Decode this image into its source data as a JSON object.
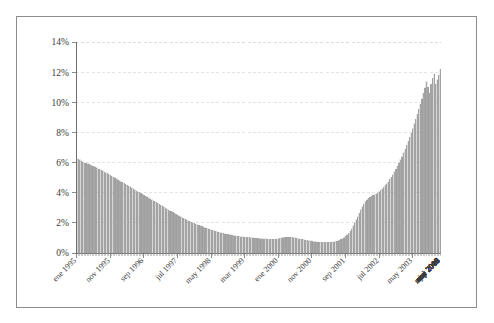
{
  "chart_data": {
    "type": "bar",
    "title": "",
    "subtitle": "",
    "xlabel": "",
    "ylabel": "",
    "ylim": [
      0,
      14
    ],
    "ytick_labels": [
      "0%",
      "2%",
      "4%",
      "6%",
      "8%",
      "10%",
      "12%",
      "14%"
    ],
    "ytick_values": [
      0,
      2,
      4,
      6,
      8,
      10,
      12,
      14
    ],
    "grid": true,
    "legend": "none",
    "xtick_labels": [
      "ene 1995",
      "nov 1995",
      "sep 1996",
      "jul 1997",
      "may 1998",
      "mar 1999",
      "ene 2000",
      "nov 2000",
      "sep 2001",
      "jul 2002",
      "may 2003",
      "mar 2004",
      "ene 2005",
      "nov 2005",
      "sep 2006",
      "jul 2007",
      "may 2008",
      "mar 2009",
      "ene 2010",
      "nov 2010",
      "sep 2011",
      "jul 2012",
      "may 2013"
    ],
    "xtick_interval_months": 22,
    "x_start": "ene 1995",
    "x_end": "jun 2013",
    "series_name": "",
    "bar_color": "#a8a8a8",
    "values": [
      6.25,
      6.22,
      6.18,
      6.12,
      6.05,
      6.0,
      5.96,
      5.92,
      5.88,
      5.84,
      5.8,
      5.76,
      5.72,
      5.66,
      5.6,
      5.55,
      5.5,
      5.45,
      5.4,
      5.34,
      5.28,
      5.22,
      5.16,
      5.1,
      5.04,
      4.98,
      4.92,
      4.86,
      4.8,
      4.74,
      4.68,
      4.62,
      4.56,
      4.5,
      4.44,
      4.38,
      4.32,
      4.26,
      4.2,
      4.14,
      4.08,
      4.02,
      3.96,
      3.9,
      3.84,
      3.78,
      3.72,
      3.66,
      3.6,
      3.54,
      3.48,
      3.42,
      3.36,
      3.3,
      3.24,
      3.18,
      3.12,
      3.06,
      3.0,
      2.94,
      2.88,
      2.82,
      2.76,
      2.7,
      2.64,
      2.58,
      2.52,
      2.46,
      2.4,
      2.35,
      2.3,
      2.25,
      2.2,
      2.15,
      2.1,
      2.05,
      2.0,
      1.96,
      1.92,
      1.88,
      1.84,
      1.8,
      1.76,
      1.72,
      1.68,
      1.64,
      1.6,
      1.57,
      1.54,
      1.51,
      1.48,
      1.45,
      1.42,
      1.39,
      1.36,
      1.33,
      1.3,
      1.28,
      1.26,
      1.24,
      1.22,
      1.2,
      1.18,
      1.16,
      1.14,
      1.12,
      1.1,
      1.09,
      1.08,
      1.07,
      1.06,
      1.05,
      1.04,
      1.03,
      1.02,
      1.01,
      1.0,
      0.99,
      0.98,
      0.97,
      0.96,
      0.95,
      0.94,
      0.93,
      0.93,
      0.92,
      0.92,
      0.91,
      0.91,
      0.9,
      0.9,
      0.92,
      0.95,
      0.98,
      1.0,
      1.02,
      1.03,
      1.04,
      1.05,
      1.05,
      1.04,
      1.03,
      1.02,
      1.0,
      0.98,
      0.96,
      0.94,
      0.92,
      0.9,
      0.88,
      0.86,
      0.84,
      0.82,
      0.8,
      0.78,
      0.76,
      0.75,
      0.74,
      0.73,
      0.72,
      0.72,
      0.71,
      0.71,
      0.7,
      0.7,
      0.7,
      0.71,
      0.72,
      0.74,
      0.76,
      0.79,
      0.82,
      0.86,
      0.9,
      0.96,
      1.02,
      1.1,
      1.2,
      1.32,
      1.46,
      1.62,
      1.8,
      2.0,
      2.2,
      2.42,
      2.64,
      2.86,
      3.06,
      3.24,
      3.4,
      3.52,
      3.62,
      3.7,
      3.76,
      3.82,
      3.88,
      3.94,
      4.0,
      4.08,
      4.16,
      4.26,
      4.36,
      4.48,
      4.6,
      4.74,
      4.88,
      5.04,
      5.2,
      5.38,
      5.56,
      5.76,
      5.96,
      6.18,
      6.4,
      6.64,
      6.88,
      7.14,
      7.4,
      7.68,
      7.96,
      8.26,
      8.56,
      8.88,
      9.2,
      9.54,
      9.88,
      10.24,
      10.6,
      10.98,
      11.36,
      11.0,
      10.6,
      11.2,
      11.6,
      11.9,
      11.2,
      11.5,
      11.8,
      12.2
    ]
  }
}
